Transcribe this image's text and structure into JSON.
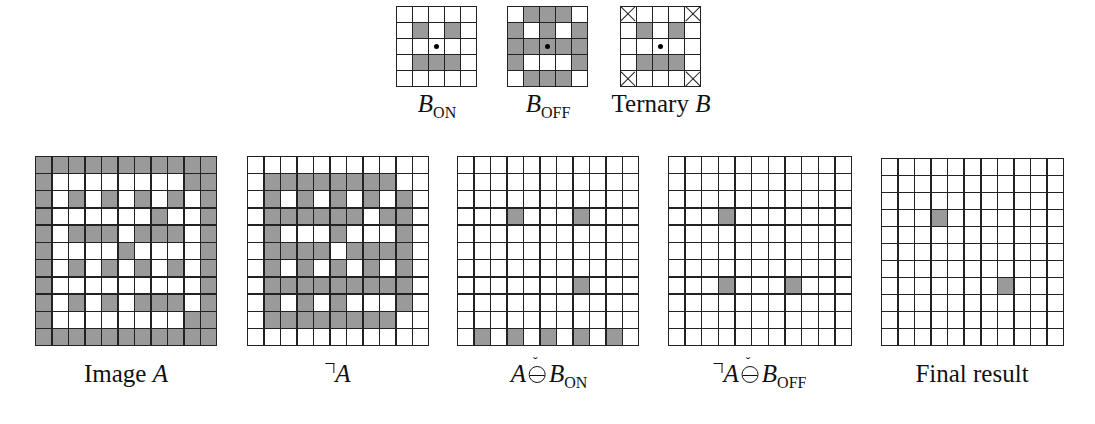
{
  "figure": {
    "kernels": [
      {
        "id": "b-on",
        "label_main": "B",
        "label_sub": "ON",
        "size": 5,
        "origin": [
          2,
          2
        ],
        "cells": [
          [
            0,
            0,
            0,
            0,
            0
          ],
          [
            0,
            1,
            0,
            1,
            0
          ],
          [
            0,
            0,
            0,
            0,
            0
          ],
          [
            0,
            1,
            1,
            1,
            0
          ],
          [
            0,
            0,
            0,
            0,
            0
          ]
        ]
      },
      {
        "id": "b-off",
        "label_main": "B",
        "label_sub": "OFF",
        "size": 5,
        "origin": [
          2,
          2
        ],
        "cells": [
          [
            0,
            1,
            1,
            1,
            0
          ],
          [
            1,
            0,
            1,
            0,
            1
          ],
          [
            1,
            1,
            1,
            1,
            1
          ],
          [
            1,
            0,
            0,
            0,
            1
          ],
          [
            0,
            1,
            1,
            1,
            0
          ]
        ]
      },
      {
        "id": "ternary-b",
        "label_prefix": "Ternary ",
        "label_main": "B",
        "size": 5,
        "origin": [
          2,
          2
        ],
        "dont_care": [
          [
            0,
            0
          ],
          [
            0,
            4
          ],
          [
            4,
            0
          ],
          [
            4,
            4
          ]
        ],
        "cells": [
          [
            0,
            0,
            0,
            0,
            0
          ],
          [
            0,
            1,
            0,
            1,
            0
          ],
          [
            0,
            0,
            0,
            0,
            0
          ],
          [
            0,
            1,
            1,
            1,
            0
          ],
          [
            0,
            0,
            0,
            0,
            0
          ]
        ]
      }
    ],
    "panels": [
      {
        "id": "image-a",
        "label": "Image A",
        "size": 11,
        "cells": [
          [
            1,
            1,
            1,
            1,
            1,
            1,
            1,
            1,
            1,
            1,
            1
          ],
          [
            1,
            0,
            0,
            0,
            0,
            0,
            0,
            0,
            0,
            1,
            1
          ],
          [
            1,
            0,
            1,
            0,
            1,
            0,
            1,
            0,
            1,
            0,
            1
          ],
          [
            1,
            0,
            0,
            0,
            0,
            0,
            0,
            1,
            0,
            0,
            1
          ],
          [
            1,
            0,
            1,
            1,
            1,
            0,
            1,
            1,
            1,
            0,
            1
          ],
          [
            1,
            0,
            0,
            0,
            0,
            1,
            0,
            0,
            0,
            0,
            1
          ],
          [
            1,
            0,
            1,
            0,
            1,
            0,
            1,
            0,
            1,
            0,
            1
          ],
          [
            1,
            0,
            0,
            0,
            0,
            0,
            0,
            0,
            0,
            0,
            1
          ],
          [
            1,
            0,
            1,
            0,
            1,
            0,
            1,
            1,
            1,
            0,
            1
          ],
          [
            1,
            0,
            0,
            0,
            0,
            0,
            0,
            0,
            0,
            1,
            1
          ],
          [
            1,
            1,
            1,
            1,
            1,
            1,
            1,
            1,
            1,
            1,
            1
          ]
        ]
      },
      {
        "id": "not-a",
        "label": "¬A",
        "size": 11,
        "derived": "complement-of-image-a"
      },
      {
        "id": "a-hitmiss-b-on",
        "label": "A ⊖̌ B_ON",
        "size": 11,
        "on_cells": [
          [
            3,
            3
          ],
          [
            3,
            7
          ],
          [
            7,
            7
          ],
          [
            10,
            1
          ],
          [
            10,
            3
          ],
          [
            10,
            5
          ],
          [
            10,
            7
          ],
          [
            10,
            9
          ]
        ]
      },
      {
        "id": "not-a-hitmiss-b-off",
        "label": "¬A ⊖̌ B_OFF",
        "size": 11,
        "on_cells": [
          [
            3,
            3
          ],
          [
            7,
            3
          ],
          [
            7,
            7
          ]
        ]
      },
      {
        "id": "final-result",
        "label": "Final result",
        "size": 11,
        "on_cells": [
          [
            3,
            3
          ],
          [
            7,
            7
          ]
        ]
      }
    ],
    "labels": {
      "image_a_prefix": "Image ",
      "image_a_var": "A",
      "not_a_var": "A",
      "op3_var": "A",
      "op3_b": "B",
      "op3_sub": "ON",
      "op4_var": "A",
      "op4_b": "B",
      "op4_sub": "OFF",
      "final": "Final result",
      "check_mark": "ˇ"
    },
    "colors": {
      "on_cell": "#9a9a9a",
      "off_cell": "#ffffff",
      "grid_line": "#222222"
    }
  }
}
